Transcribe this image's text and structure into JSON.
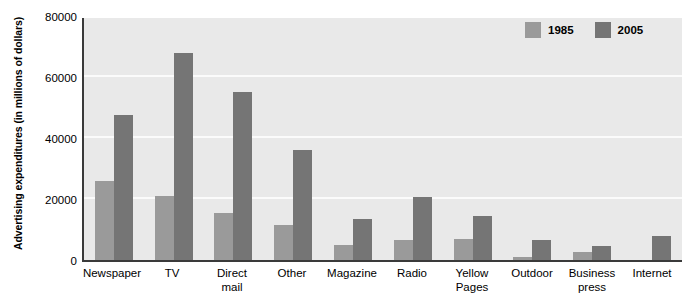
{
  "chart_data": {
    "type": "bar",
    "title": "",
    "xlabel": "",
    "ylabel": "Advertising expenditures\n(in millions of dollars)",
    "ylim": [
      0,
      80000
    ],
    "ytick_labels": [
      "80000",
      "60000",
      "40000",
      "20000",
      "0"
    ],
    "ytick_values": [
      80000,
      60000,
      40000,
      20000,
      0
    ],
    "grid": true,
    "gridlines_at": [
      20000,
      40000,
      60000
    ],
    "legend_position": "top-right",
    "categories": [
      "Newspaper",
      "TV",
      "Direct\nmail",
      "Other",
      "Magazine",
      "Radio",
      "Yellow\nPages",
      "Outdoor",
      "Business\npress",
      "Internet"
    ],
    "series": [
      {
        "name": "1985",
        "color": "#9a9a9a",
        "values": [
          26000,
          21000,
          15500,
          11500,
          5000,
          6500,
          7000,
          1000,
          2500,
          0
        ]
      },
      {
        "name": "2005",
        "color": "#757575",
        "values": [
          47500,
          68000,
          55000,
          36000,
          13500,
          20500,
          14500,
          6500,
          4500,
          8000
        ]
      }
    ]
  },
  "legend": {
    "items": [
      {
        "label": "1985"
      },
      {
        "label": "2005"
      }
    ]
  },
  "colors": {
    "plot_background": "#e9e9e9",
    "gridline": "#fbfbfb",
    "axis": "#3a3a3a",
    "series_1985": "#9a9a9a",
    "series_2005": "#757575",
    "page_background": "#ffffff"
  }
}
